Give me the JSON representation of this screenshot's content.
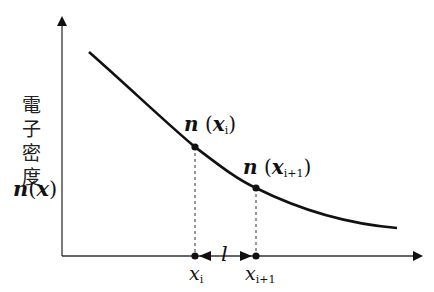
{
  "diagram": {
    "type": "electron-density-curve",
    "y_axis_label": {
      "chars": [
        "電",
        "子",
        "密",
        "度"
      ],
      "symbol_fn": "n",
      "symbol_arg": "x"
    },
    "points": [
      {
        "label_fn": "n",
        "label_arg": "x",
        "label_sub": "i",
        "axis_label": "x",
        "axis_sub": "i"
      },
      {
        "label_fn": "n",
        "label_arg": "x",
        "label_sub": "i+1",
        "axis_label": "x",
        "axis_sub": "i+1"
      }
    ],
    "interval_label": "l",
    "colors": {
      "line": "#111111",
      "axis": "#333333"
    }
  }
}
